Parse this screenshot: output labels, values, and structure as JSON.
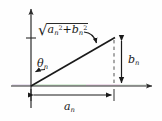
{
  "figure": {
    "background_color": "#fefefe",
    "stroke_color": "#1a1a1a",
    "axis_color": "#2b2b2b"
  },
  "labels": {
    "magnitude": {
      "radical_sign": "√",
      "term_a_base": "a",
      "term_a_sub": "n",
      "term_a_exp": "2",
      "operator": "+",
      "term_b_base": "b",
      "term_b_sub": "n",
      "term_b_exp": "2",
      "plain_text": "√(aₙ² + bₙ²)"
    },
    "angle": {
      "symbol": "θ",
      "subscript": "n",
      "plain_text": "θₙ"
    },
    "vertical_component": {
      "symbol": "b",
      "subscript": "n",
      "plain_text": "bₙ"
    },
    "horizontal_component": {
      "symbol": "a",
      "subscript": "n",
      "plain_text": "aₙ"
    }
  },
  "geometry": {
    "origin": {
      "x": 31,
      "y": 86
    },
    "hypotenuse_tip": {
      "x": 114,
      "y": 38
    },
    "x_axis": {
      "x1": 11,
      "y1": 86,
      "x2": 155,
      "y2": 86
    },
    "y_axis": {
      "x1": 31,
      "y1": 108,
      "x2": 31,
      "y2": 6
    },
    "y_axis_tick_y": 38,
    "dashed_drop_line": {
      "x": 114,
      "y1": 39,
      "y2": 85
    },
    "b_measure_arrow": {
      "x": 121,
      "y1": 38,
      "y2": 86
    },
    "a_measure_arrow": {
      "y": 95,
      "x1": 31,
      "x2": 114
    },
    "callout_arrow": {
      "from_x": 86,
      "from_y": 34,
      "to_x": 97,
      "to_y": 45
    },
    "theta_arrow": {
      "from_x": 44,
      "from_y": 68,
      "to_x": 34,
      "to_y": 72
    }
  }
}
